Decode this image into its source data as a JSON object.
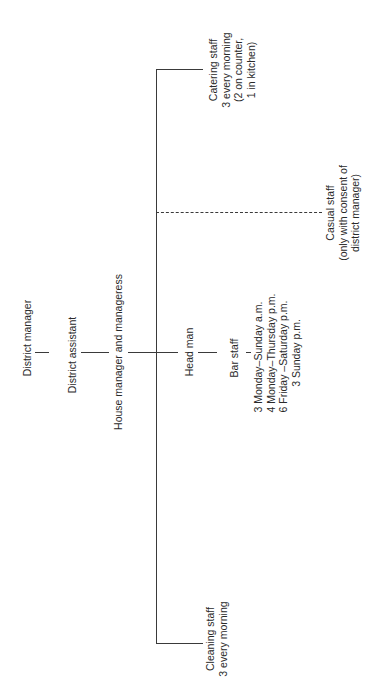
{
  "diagram": {
    "type": "organization-chart",
    "orientation": "rotated-90-ccw",
    "line_color": "#3a3a3a",
    "nodes": {
      "district_manager": {
        "lines": [
          "District manager"
        ]
      },
      "district_assistant": {
        "lines": [
          "District assistant"
        ]
      },
      "house_manager": {
        "lines": [
          "House manager and manageress"
        ]
      },
      "head_man": {
        "lines": [
          "Head man"
        ]
      },
      "bar_staff": {
        "lines": [
          "Bar staff"
        ]
      },
      "bar_schedule": {
        "lines": [
          "3 Monday–Sunday a.m.",
          "4 Monday–Thursday p.m.",
          "6 Friday –Saturday p.m.",
          "3 Sunday p.m."
        ]
      },
      "catering_staff": {
        "lines": [
          "Catering staff",
          "3 every morning",
          "(2 on counter,",
          "1 in kitchen)"
        ]
      },
      "casual_staff": {
        "lines": [
          "Casual staff",
          "(only with consent of",
          "district manager)"
        ]
      },
      "cleaning_staff": {
        "lines": [
          "Cleaning staff",
          "3 every morning"
        ]
      }
    },
    "edges": [
      {
        "from": "District manager",
        "to": "District assistant",
        "style": "solid"
      },
      {
        "from": "District assistant",
        "to": "House manager and manageress",
        "style": "solid"
      },
      {
        "from": "House manager and manageress",
        "to": "Head man",
        "style": "solid"
      },
      {
        "from": "Head man",
        "to": "Bar staff",
        "style": "solid"
      },
      {
        "from": "House manager and manageress",
        "to": "Catering staff",
        "style": "solid"
      },
      {
        "from": "House manager and manageress",
        "to": "Casual staff",
        "style": "dashed"
      },
      {
        "from": "House manager and manageress",
        "to": "Cleaning staff",
        "style": "solid"
      }
    ]
  }
}
